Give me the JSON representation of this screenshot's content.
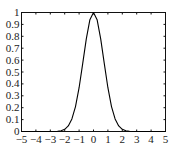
{
  "chart_data": {
    "type": "line",
    "title": "",
    "xlabel": "",
    "ylabel": "",
    "xlim": [
      -5,
      5
    ],
    "ylim": [
      0,
      1
    ],
    "grid": false,
    "legend": null,
    "x_ticks": [
      -5,
      -4,
      -3,
      -2,
      -1,
      0,
      1,
      2,
      3,
      4,
      5
    ],
    "y_ticks": [
      0,
      0.1,
      0.2,
      0.3,
      0.4,
      0.5,
      0.6,
      0.7,
      0.8,
      0.9,
      1
    ],
    "x_tick_labels": [
      "−5",
      "−4",
      "−3",
      "−2",
      "−1",
      "0",
      "1",
      "2",
      "3",
      "4",
      "5"
    ],
    "y_tick_labels": [
      "0",
      "0.1",
      "0.2",
      "0.3",
      "0.4",
      "0.5",
      "0.6",
      "0.7",
      "0.8",
      "0.9",
      "1"
    ],
    "series": [
      {
        "name": "exp(-x^2)",
        "color": "#000000",
        "x": [
          -5,
          -4.5,
          -4,
          -3.5,
          -3,
          -2.75,
          -2.5,
          -2.25,
          -2,
          -1.75,
          -1.5,
          -1.25,
          -1,
          -0.75,
          -0.5,
          -0.25,
          0,
          0.25,
          0.5,
          0.75,
          1,
          1.25,
          1.5,
          1.75,
          2,
          2.25,
          2.5,
          2.75,
          3,
          3.5,
          4,
          4.5,
          5
        ],
        "y": [
          0,
          0,
          0,
          0,
          0.0001,
          0.0005,
          0.0019,
          0.0063,
          0.0183,
          0.0468,
          0.1054,
          0.2096,
          0.3679,
          0.5698,
          0.7788,
          0.9394,
          1,
          0.9394,
          0.7788,
          0.5698,
          0.3679,
          0.2096,
          0.1054,
          0.0468,
          0.0183,
          0.0063,
          0.0019,
          0.0005,
          0.0001,
          0,
          0,
          0,
          0
        ]
      }
    ]
  }
}
